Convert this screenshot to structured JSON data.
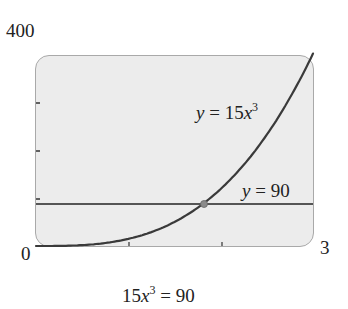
{
  "chart_data": {
    "type": "line",
    "title": "",
    "caption": "15x^3 = 90",
    "xlabel": "",
    "ylabel": "",
    "xlim": [
      0,
      3
    ],
    "ylim": [
      0,
      400
    ],
    "x_tick_labels": [
      "0",
      "3"
    ],
    "y_tick_labels": [
      "400"
    ],
    "x_minor_ticks": [
      1,
      2
    ],
    "y_minor_ticks": [
      100,
      200,
      300
    ],
    "grid": false,
    "series": [
      {
        "name": "y = 15x^3",
        "expr": "15*x^3",
        "x": [
          0,
          0.5,
          1,
          1.5,
          1.817,
          2,
          2.5,
          3
        ],
        "values": [
          0,
          1.875,
          15,
          50.625,
          90,
          120,
          234.375,
          405
        ]
      },
      {
        "name": "y = 90",
        "expr": "90",
        "x": [
          0,
          3
        ],
        "values": [
          90,
          90
        ]
      }
    ],
    "annotations": [
      {
        "type": "point",
        "label": "intersection",
        "x": 1.817,
        "y": 90
      }
    ],
    "colors": {
      "curve": "#3a3a3a",
      "hline": "#555555",
      "plot_bg": "#ececec",
      "frame": "#a9a9a9",
      "point": "#8a8a8a"
    }
  },
  "labels": {
    "y_max": "400",
    "x_min": "0",
    "x_max": "3",
    "curve_label_lhs": "y",
    "curve_label_eq": " = 15",
    "curve_label_var": "x",
    "curve_label_exp": "3",
    "hline_label_lhs": "y",
    "hline_label_eq": " = 90",
    "caption_coef": "15",
    "caption_var": "x",
    "caption_exp": "3",
    "caption_rhs": " = 90"
  }
}
